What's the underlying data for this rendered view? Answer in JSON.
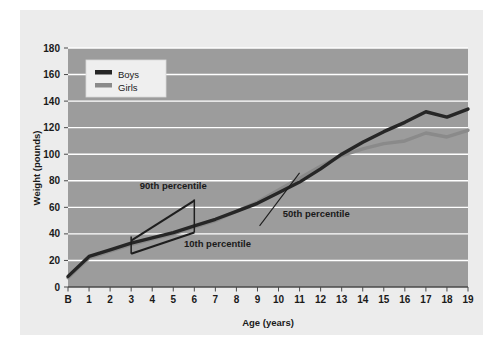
{
  "figure": {
    "panel_bg": "#ececec",
    "plot_bg": "#9c9c9c",
    "gridline_color": "#ffffff",
    "axis_color": "#4a4a4a",
    "page_bg": "#ffffff"
  },
  "chart_data": {
    "type": "line",
    "title": "",
    "xlabel": "Age (years)",
    "ylabel": "Weight (pounds)",
    "xlim": [
      0,
      19
    ],
    "ylim": [
      0,
      180
    ],
    "ytick_step": 20,
    "grid": true,
    "legend_position": "top-left",
    "categories": [
      "B",
      "1",
      "2",
      "3",
      "4",
      "5",
      "6",
      "7",
      "8",
      "9",
      "10",
      "11",
      "12",
      "13",
      "14",
      "15",
      "16",
      "17",
      "18",
      "19"
    ],
    "x": [
      0,
      1,
      2,
      3,
      4,
      5,
      6,
      7,
      8,
      9,
      10,
      11,
      12,
      13,
      14,
      15,
      16,
      17,
      18,
      19
    ],
    "yticks": [
      0,
      20,
      40,
      60,
      80,
      100,
      120,
      140,
      160,
      180
    ],
    "ytick_labels": [
      "0",
      "20",
      "40",
      "60",
      "80",
      "100",
      "120",
      "140",
      "160",
      "180"
    ],
    "series": [
      {
        "name": "Boys",
        "color": "#262626",
        "values": [
          8,
          23,
          28,
          33,
          37,
          41,
          46,
          51,
          57,
          63,
          71,
          79,
          89,
          100,
          109,
          117,
          124,
          132,
          128,
          134
        ]
      },
      {
        "name": "Girls",
        "color": "#8a8a8a",
        "values": [
          7,
          22,
          27,
          32,
          36,
          40,
          45,
          50,
          57,
          64,
          73,
          82,
          91,
          99,
          104,
          108,
          110,
          116,
          113,
          118
        ]
      }
    ],
    "annotations": [
      {
        "name": "90th-percentile",
        "label": "90th percentile",
        "label_x": 5.0,
        "label_y": 74,
        "line": [
          [
            3,
            35
          ],
          [
            6,
            65
          ]
        ],
        "brackets": [
          [
            3,
            26
          ],
          [
            6,
            45
          ]
        ]
      },
      {
        "name": "10th-percentile",
        "label": "10th percentile",
        "label_x": 7.1,
        "label_y": 30,
        "line": [
          [
            3,
            25
          ],
          [
            6,
            41
          ]
        ],
        "brackets": []
      },
      {
        "name": "50th-percentile",
        "label": "50th percentile",
        "label_x": 10.2,
        "label_y": 53,
        "leader": [
          [
            9.1,
            46
          ],
          [
            11.0,
            86
          ]
        ]
      }
    ],
    "legend": {
      "entries": [
        {
          "label": "Boys",
          "color": "#262626"
        },
        {
          "label": "Girls",
          "color": "#8a8a8a"
        }
      ]
    }
  }
}
